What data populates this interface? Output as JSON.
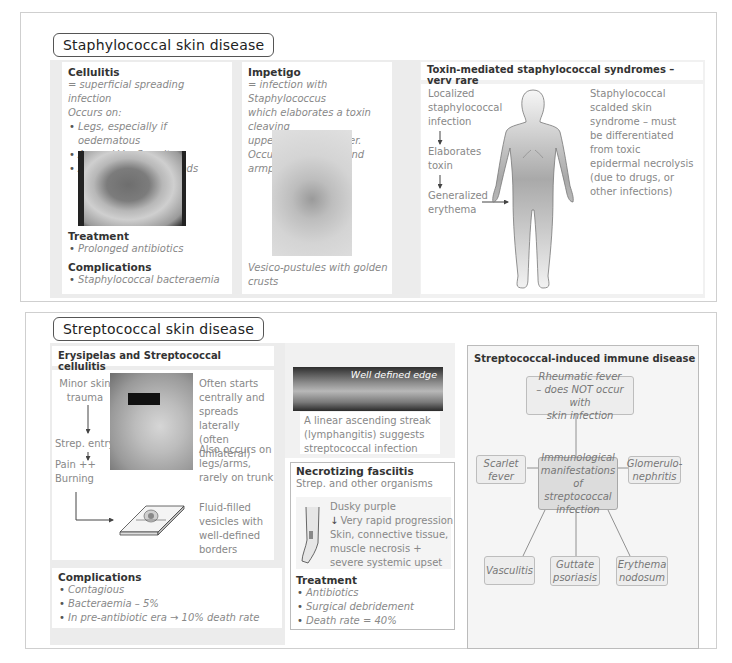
{
  "staph": {
    "title": "Staphylococcal skin disease",
    "cellulitis": {
      "heading": "Cellulitis",
      "definition": "= superficial spreading infection",
      "occurs_label": "Occurs on:",
      "sites": [
        "Legs, especially if oedematous",
        "Around Venflon sites",
        "Around surgical wounds"
      ],
      "treatment_heading": "Treatment",
      "treatment": [
        "Prolonged antibiotics"
      ],
      "complications_heading": "Complications",
      "complications": [
        "Staphylococcal bacteraemia"
      ]
    },
    "impetigo": {
      "heading": "Impetigo",
      "line1": "= infection with Staphylococcus",
      "line2": "which elaborates a toxin cleaving",
      "line3": "upper epidermal layer.",
      "line4": "Occurs on the face and armpits",
      "caption1": "Vesico-pustules with golden",
      "caption2": "crusts"
    },
    "toxin": {
      "heading": "Toxin-mediated staphylococcal syndromes – very rare",
      "flow": [
        "Localized",
        "staphylococcal",
        "infection",
        "Elaborates",
        "toxin",
        "Generalized",
        "erythema"
      ],
      "side": [
        "Staphylococcal",
        "scalded skin",
        "syndrome – must",
        "be differentiated",
        "from toxic",
        "epidermal necrolysis",
        "(due to drugs, or",
        "other infections)"
      ]
    }
  },
  "strep": {
    "title": "Streptococcal skin disease",
    "erysipelas": {
      "heading": "Erysipelas and Streptococcal cellulitis",
      "flow": {
        "trauma1": "Minor skin",
        "trauma2": "trauma",
        "entry": "Strep. entry",
        "pain1": "Pain ++",
        "pain2": "Burning"
      },
      "notes": {
        "a": [
          "Often starts",
          "centrally and",
          "spreads laterally",
          "(often unilateral)"
        ],
        "b": [
          "Also occurs on",
          "legs/arms,",
          "rarely on trunk"
        ],
        "c": [
          "Fluid-filled",
          "vesicles with",
          "well-defined",
          "borders"
        ]
      },
      "complications_heading": "Complications",
      "complications": [
        "Contagious",
        "Bacteraemia – 5%",
        "In pre-antibiotic era → 10% death rate"
      ]
    },
    "leg_photo": {
      "label": "Well defined edge",
      "caption": [
        "A linear ascending streak",
        "(lymphangitis) suggests",
        "streptococcal infection"
      ]
    },
    "necrotizing": {
      "heading": "Necrotizing fasciitis",
      "subheading": "Strep. and other organisms",
      "lines": [
        "Dusky purple",
        "Very rapid progression",
        "Skin, connective tissue,",
        "muscle necrosis +",
        "severe systemic upset"
      ],
      "treatment_heading": "Treatment",
      "treatment": [
        "Antibiotics",
        "Surgical debridement",
        "Death rate = 40%"
      ]
    },
    "immune": {
      "heading": "Streptococcal-induced immune disease",
      "top": [
        "Rheumatic fever",
        "– does NOT occur with",
        "skin infection"
      ],
      "center": [
        "Immunological",
        "manifestations of",
        "streptococcal",
        "infection"
      ],
      "left": [
        "Scarlet",
        "fever"
      ],
      "right": [
        "Glomerulo-",
        "nephritis"
      ],
      "bottom_left": [
        "Vasculitis"
      ],
      "bottom_mid": [
        "Guttate",
        "psoriasis"
      ],
      "bottom_right": [
        "Erythema",
        "nodosum"
      ]
    }
  }
}
